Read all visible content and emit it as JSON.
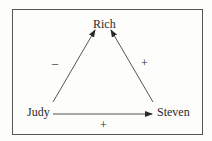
{
  "diagram": {
    "type": "signed-relationship-triangle",
    "nodes": [
      {
        "id": "rich",
        "label": "Rich"
      },
      {
        "id": "judy",
        "label": "Judy"
      },
      {
        "id": "steven",
        "label": "Steven"
      }
    ],
    "edges": [
      {
        "from": "judy",
        "to": "rich",
        "sign": "–"
      },
      {
        "from": "steven",
        "to": "rich",
        "sign": "+"
      },
      {
        "from": "judy",
        "to": "steven",
        "sign": "+"
      }
    ],
    "colors": {
      "ink": "#2a2a2a",
      "frame": "#555555",
      "background": "#fdfdfb"
    }
  }
}
